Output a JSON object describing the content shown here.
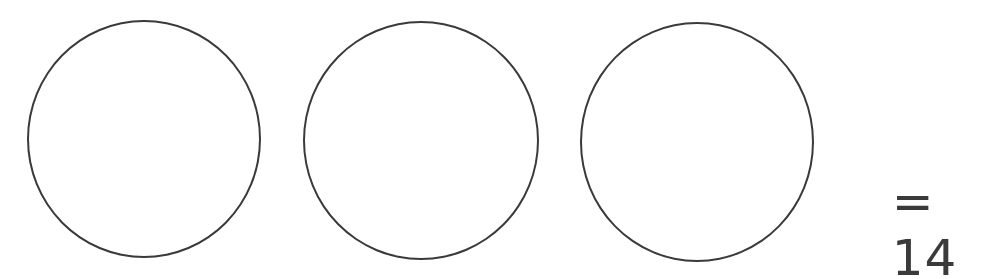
{
  "diagram": {
    "circles": [
      {
        "label": "",
        "cx": 144,
        "cy": 137,
        "r": 117
      },
      {
        "label": "",
        "cx": 420,
        "cy": 139,
        "r": 117
      },
      {
        "label": "",
        "cx": 697,
        "cy": 140,
        "r": 117
      }
    ],
    "equation": {
      "operator": "=",
      "result": "14",
      "text": "= 14"
    },
    "colors": {
      "stroke": "#3a3a3a",
      "background": "#ffffff"
    }
  }
}
